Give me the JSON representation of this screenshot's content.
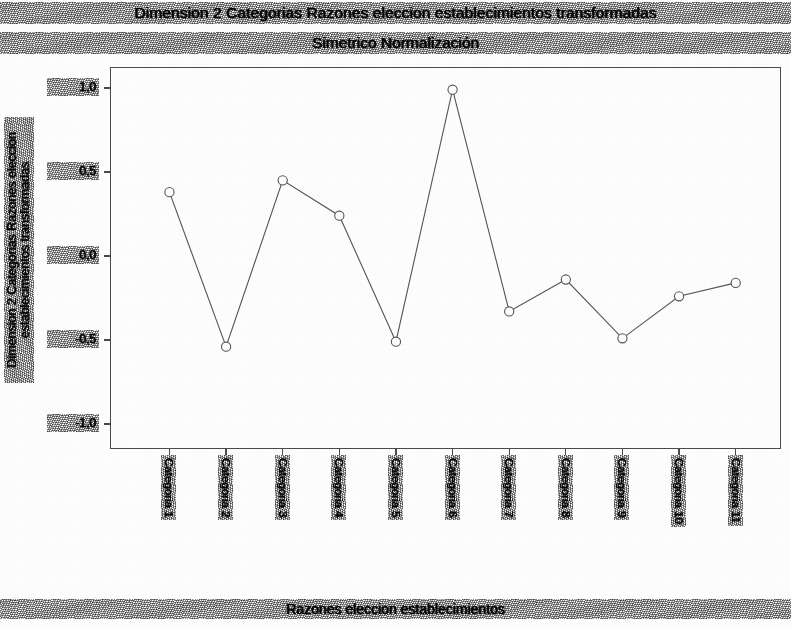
{
  "chart_data": {
    "type": "line",
    "title": "Dimension 2 Categorias Razones eleccion establecimientos transformadas",
    "subtitle": "Simetrico Normalización",
    "xlabel": "Razones eleccion establecimientos",
    "ylabel": "Dimension 2 Categorias Razones eleccion establecimientos transformadas",
    "ylim": [
      -1.0,
      1.0
    ],
    "yticks": [
      1.0,
      0.5,
      0.0,
      -0.5,
      -1.0
    ],
    "ytick_labels": [
      "1,0",
      "0,5",
      "0,0",
      "-0,5",
      "-1,0"
    ],
    "grid": false,
    "legend": "none",
    "marker": "open-circle",
    "line_color": "#555555",
    "marker_color": "#555555",
    "categories": [
      "Categoria 1",
      "Categoria 2",
      "Categoria 3",
      "Categoria 4",
      "Categoria 5",
      "Categoria 6",
      "Categoria 7",
      "Categoria 8",
      "Categoria 9",
      "Categoria 10",
      "Categoria 11"
    ],
    "values": [
      0.38,
      -0.54,
      0.45,
      0.24,
      -0.51,
      0.99,
      -0.33,
      -0.14,
      -0.49,
      -0.24,
      -0.16
    ],
    "n_points": 11
  },
  "axes": {
    "y_title": "Dimension 2 Categorias Razones eleccion establecimientos transformadas",
    "x_title": "Razones eleccion establecimientos"
  },
  "header": {
    "title": "Dimension 2 Categorias Razones eleccion establecimientos transformadas",
    "subtitle": "Simetrico Normalización"
  }
}
